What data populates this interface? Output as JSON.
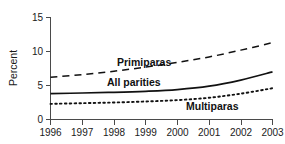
{
  "chart_data": {
    "type": "line",
    "title": "",
    "subtitle": "",
    "xlabel": "",
    "ylabel": "Percent",
    "x": [
      1996,
      1997,
      1998,
      1999,
      2000,
      2001,
      2002,
      2003
    ],
    "xticklabels": [
      "1996",
      "1997",
      "1998",
      "1999",
      "2000",
      "2001",
      "2002",
      "2003"
    ],
    "yticklabels": [
      "0",
      "5",
      "10",
      "15"
    ],
    "yticks": [
      0,
      5,
      10,
      15
    ],
    "xlim": [
      1996,
      2003
    ],
    "ylim": [
      0,
      15
    ],
    "grid": false,
    "legend_position": "inline-annotations",
    "series": [
      {
        "name": "Primiparas",
        "style": "dashed",
        "color": "#111111",
        "values": [
          6.2,
          6.6,
          7.1,
          7.7,
          8.4,
          9.2,
          10.2,
          11.3
        ]
      },
      {
        "name": "All parities",
        "style": "solid",
        "color": "#111111",
        "values": [
          3.8,
          3.9,
          4.0,
          4.15,
          4.4,
          4.9,
          5.8,
          7.0
        ]
      },
      {
        "name": "Multiparas",
        "style": "dotted",
        "color": "#111111",
        "values": [
          2.3,
          2.4,
          2.5,
          2.65,
          2.85,
          3.2,
          3.8,
          4.6
        ]
      }
    ],
    "annotations": [
      {
        "text": "Primiparas",
        "x": 1998.9,
        "y": 8.75
      },
      {
        "text": "All parities",
        "x": 1998.5,
        "y": 5.6
      },
      {
        "text": "Multiparas",
        "x": 2001.1,
        "y": 2.05
      }
    ]
  }
}
